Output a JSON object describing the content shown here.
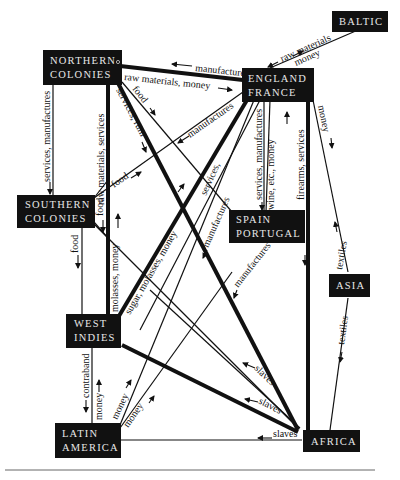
{
  "nodes": {
    "northern_colonies": {
      "line1": "NORTHERN",
      "line2": "COLONIES"
    },
    "england_france": {
      "line1": "ENGLAND",
      "line2": "FRANCE"
    },
    "baltic": {
      "line1": "BALTIC"
    },
    "southern_colonies": {
      "line1": "SOUTHERN",
      "line2": "COLONIES"
    },
    "spain_portugal": {
      "line1": "SPAIN",
      "line2": "PORTUGAL"
    },
    "asia": {
      "line1": "ASIA"
    },
    "west_indies": {
      "line1": "WEST",
      "line2": "INDIES"
    },
    "latin_america": {
      "line1": "LATIN",
      "line2": "AMERICA"
    },
    "africa": {
      "line1": "AFRICA"
    }
  },
  "labels": {
    "nc_ef_manufactures": "manufactures",
    "nc_ef_raw_money": "raw materials, money",
    "baltic_raw": "raw materials",
    "baltic_money": "money",
    "nc_sc_services_manufactures": "services, manufactures",
    "nc_wi_raw_services": "raw materials, services",
    "nc_food": "food",
    "nc_services_rum": "services, rum",
    "sc_manufactures": "manufactures",
    "sc_food_to_ef": "food",
    "sc_food_wi": "food",
    "sc_food_down": "food",
    "wi_molasses_money": "molasses, money",
    "wi_sugar_molasses_money": "sugar, molasses, money",
    "ef_manufactures_down": "manufactures",
    "services_mid": "services,",
    "ef_sp_services_manufactures": "services, manufactures",
    "ef_sp_wine_money": "wine, etc., money",
    "ef_africa_firearms_services": "firearms, services",
    "ef_asia_money": "money",
    "sp_manufactures": "manufactures",
    "asia_textiles_up": "textiles",
    "asia_textiles_down": "textiles",
    "slaves_1": "slaves",
    "slaves_2": "slaves",
    "slaves_3": "slaves",
    "wi_la_contraband": "contraband",
    "wi_la_money": "money",
    "la_money_1": "money",
    "la_money_2": "money"
  }
}
